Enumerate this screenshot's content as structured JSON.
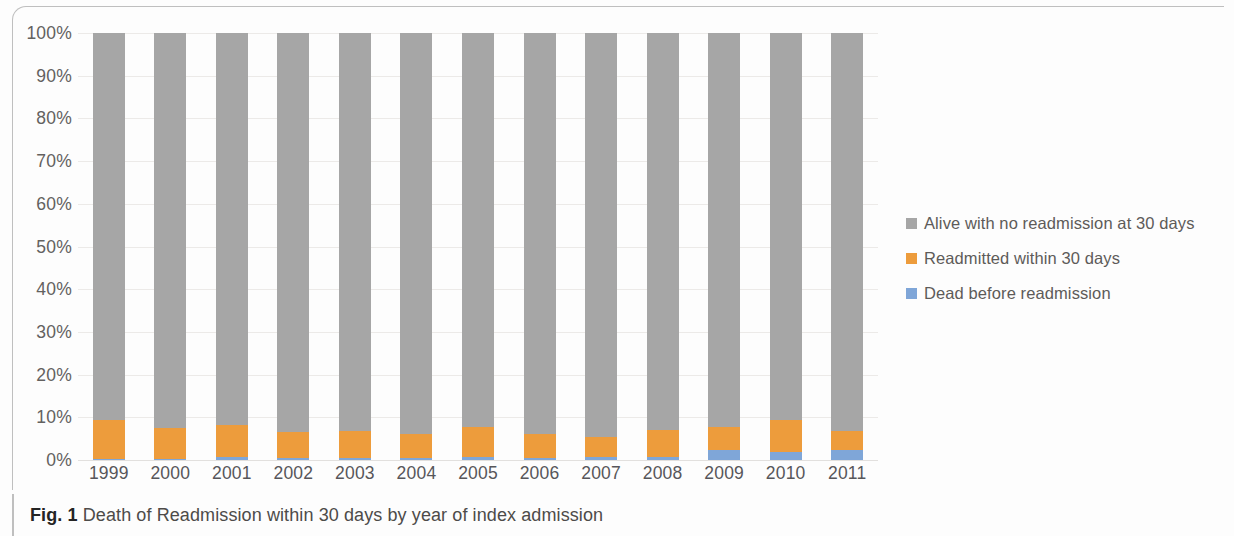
{
  "figure": {
    "caption_prefix": "Fig. 1",
    "caption_text": "Death of Readmission within 30 days by year of index admission"
  },
  "colors": {
    "alive": "#a6a6a6",
    "readmitted": "#ed9c3c",
    "dead": "#7fa6d8",
    "gridline": "#eceae8",
    "axis_text": "#63615f"
  },
  "legend": {
    "position": "right",
    "items": [
      {
        "label": "Alive with no readmission at 30 days",
        "color": "#a6a6a6",
        "swatch": "square-swatch-gray"
      },
      {
        "label": "Readmitted within 30 days",
        "color": "#ed9c3c",
        "swatch": "square-swatch-orange"
      },
      {
        "label": "Dead before readmission",
        "color": "#7fa6d8",
        "swatch": "square-swatch-blue"
      }
    ]
  },
  "chart_data": {
    "type": "bar",
    "subtype": "stacked-100-percent",
    "title": "Death of Readmission within 30 days by year of index admission",
    "xlabel": "",
    "ylabel": "",
    "ylim": [
      0,
      100
    ],
    "grid": true,
    "legend_position": "right",
    "categories": [
      "1999",
      "2000",
      "2001",
      "2002",
      "2003",
      "2004",
      "2005",
      "2006",
      "2007",
      "2008",
      "2009",
      "2010",
      "2011"
    ],
    "ytick_labels": [
      "0%",
      "10%",
      "20%",
      "30%",
      "40%",
      "50%",
      "60%",
      "70%",
      "80%",
      "90%",
      "100%"
    ],
    "ytick_values": [
      0,
      10,
      20,
      30,
      40,
      50,
      60,
      70,
      80,
      90,
      100
    ],
    "series": [
      {
        "name": "Dead before readmission",
        "color": "#7fa6d8",
        "values": [
          0.3,
          0.3,
          0.8,
          0.5,
          0.4,
          0.5,
          0.6,
          0.5,
          0.6,
          0.7,
          2.3,
          1.9,
          2.3
        ]
      },
      {
        "name": "Readmitted within 30 days",
        "color": "#ed9c3c",
        "values": [
          9.0,
          7.2,
          7.4,
          6.1,
          6.4,
          5.6,
          7.2,
          5.6,
          4.7,
          6.3,
          5.5,
          7.4,
          4.5
        ]
      },
      {
        "name": "Alive with no readmission at 30 days",
        "color": "#a6a6a6",
        "values": [
          90.7,
          92.5,
          91.8,
          93.4,
          93.2,
          93.9,
          92.2,
          93.9,
          94.7,
          93.0,
          92.2,
          90.7,
          93.2
        ]
      }
    ]
  }
}
